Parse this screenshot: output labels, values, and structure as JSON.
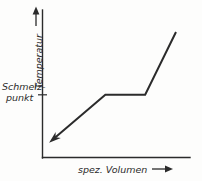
{
  "figure": {
    "background_color": "#fdfdfc",
    "ink_color": "#2b2b2b"
  },
  "labels": {
    "y_axis": "Temperatur",
    "x_axis": "spez. Volumen",
    "melting_point_line_1": "Schmelz-",
    "melting_point_line_2": "punkt"
  },
  "icons": {
    "y_axis_arrow": "arrow-up-icon",
    "x_axis_arrow": "arrow-right-icon",
    "curve_start_arrow": "arrow-down-left-icon"
  },
  "chart_data": {
    "type": "line",
    "title": "",
    "subtitle": "",
    "xlabel": "spez. Volumen",
    "ylabel": "Temperatur",
    "grid": false,
    "legend": null,
    "xlim": [
      0,
      100
    ],
    "ylim": [
      0,
      100
    ],
    "axis_ticks": {
      "x": [],
      "y": [
        "Schmelz- punkt"
      ]
    },
    "annotations": [
      {
        "text": "Schmelz- punkt",
        "axis": "y",
        "value": 42.5,
        "tick": true
      }
    ],
    "series": [
      {
        "name": "Zustandskurve",
        "points": [
          {
            "x": 6.8,
            "y": 12.0
          },
          {
            "x": 42.6,
            "y": 42.5
          },
          {
            "x": 69.6,
            "y": 42.5
          },
          {
            "x": 90.5,
            "y": 85.1
          }
        ],
        "start_arrow": true,
        "color": "#2b2b2b"
      }
    ]
  }
}
